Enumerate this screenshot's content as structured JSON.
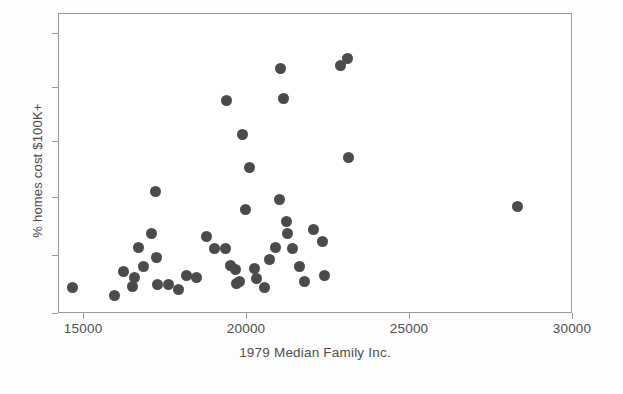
{
  "chart_data": {
    "type": "scatter",
    "title": "",
    "xlabel": "1979 Median Family Inc.",
    "ylabel": "% homes cost $100K+",
    "xlim": [
      14230,
      30000
    ],
    "ylim": [
      0,
      100
    ],
    "xticks": [
      15000,
      20000,
      25000,
      30000
    ],
    "xticklabels": [
      "15000",
      "20000",
      "25000",
      "30000"
    ],
    "yticks": [
      0,
      19.3,
      38.7,
      57.4,
      75.5,
      93.5
    ],
    "yticklabels": [
      "",
      "",
      "",
      "",
      "",
      ""
    ],
    "grid": false,
    "legend": null,
    "marker": {
      "shape": "circle",
      "color": "#4b4b4b",
      "size_px": 11
    },
    "series": [
      {
        "name": "states",
        "points": [
          {
            "x": 14630,
            "y": 9.0
          },
          {
            "x": 15920,
            "y": 6.3
          },
          {
            "x": 16200,
            "y": 14.3
          },
          {
            "x": 16680,
            "y": 22.3
          },
          {
            "x": 17060,
            "y": 27.0
          },
          {
            "x": 17180,
            "y": 40.7
          },
          {
            "x": 17210,
            "y": 18.7
          },
          {
            "x": 16830,
            "y": 16.0
          },
          {
            "x": 16560,
            "y": 12.3
          },
          {
            "x": 16470,
            "y": 9.3
          },
          {
            "x": 17240,
            "y": 10.0
          },
          {
            "x": 17600,
            "y": 10.0
          },
          {
            "x": 17910,
            "y": 8.3
          },
          {
            "x": 18130,
            "y": 12.7
          },
          {
            "x": 18440,
            "y": 12.3
          },
          {
            "x": 18770,
            "y": 26.0
          },
          {
            "x": 19010,
            "y": 21.7
          },
          {
            "x": 19330,
            "y": 21.7
          },
          {
            "x": 19380,
            "y": 71.3
          },
          {
            "x": 19500,
            "y": 16.3
          },
          {
            "x": 19630,
            "y": 14.7
          },
          {
            "x": 19670,
            "y": 10.3
          },
          {
            "x": 19760,
            "y": 11.0
          },
          {
            "x": 19860,
            "y": 59.7
          },
          {
            "x": 19950,
            "y": 34.7
          },
          {
            "x": 20070,
            "y": 49.0
          },
          {
            "x": 20230,
            "y": 15.3
          },
          {
            "x": 20300,
            "y": 12.0
          },
          {
            "x": 20520,
            "y": 8.7
          },
          {
            "x": 20700,
            "y": 18.3
          },
          {
            "x": 20860,
            "y": 22.3
          },
          {
            "x": 21010,
            "y": 38.3
          },
          {
            "x": 21040,
            "y": 81.7
          },
          {
            "x": 21110,
            "y": 72.0
          },
          {
            "x": 21210,
            "y": 30.7
          },
          {
            "x": 21250,
            "y": 26.7
          },
          {
            "x": 21380,
            "y": 22.0
          },
          {
            "x": 21600,
            "y": 15.7
          },
          {
            "x": 21770,
            "y": 11.0
          },
          {
            "x": 22030,
            "y": 28.3
          },
          {
            "x": 22300,
            "y": 24.3
          },
          {
            "x": 22390,
            "y": 12.7
          },
          {
            "x": 22880,
            "y": 83.0
          },
          {
            "x": 23080,
            "y": 85.3
          },
          {
            "x": 23110,
            "y": 52.3
          },
          {
            "x": 28300,
            "y": 35.7
          }
        ]
      }
    ]
  }
}
